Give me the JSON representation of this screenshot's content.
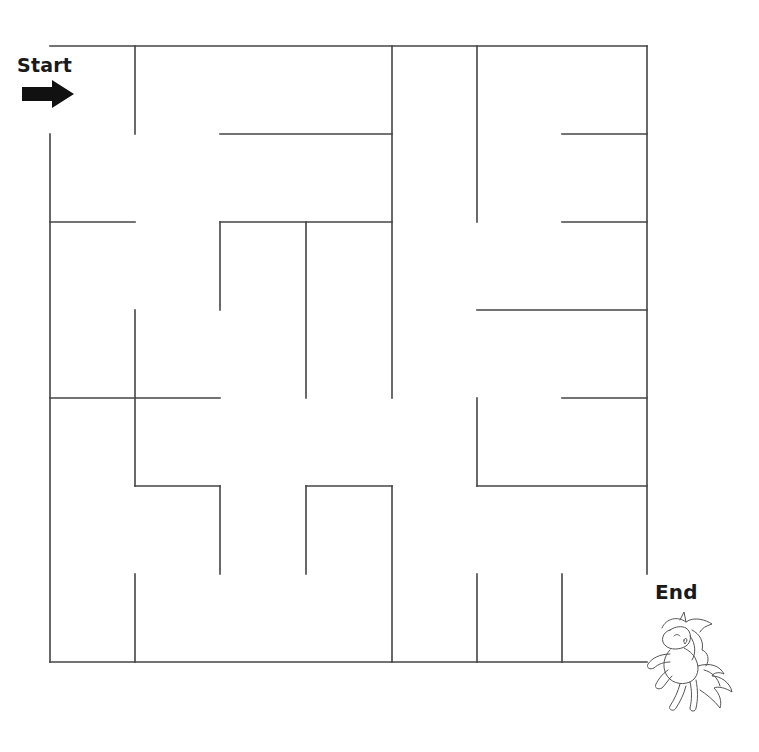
{
  "labels": {
    "start": "Start",
    "end": "End"
  },
  "icons": {
    "start_arrow": "right-arrow-icon",
    "end_character": "unicorn-icon"
  },
  "colors": {
    "wall": "#444444",
    "background": "#ffffff",
    "text": "#1a1a1a"
  },
  "maze": {
    "rows": 7,
    "cols": 7,
    "grid_x": [
      50,
      135,
      220,
      306,
      392,
      477,
      562,
      647
    ],
    "grid_y": [
      46,
      134,
      222,
      310,
      398,
      486,
      574,
      662
    ],
    "entrance": {
      "side": "left",
      "row": 0
    },
    "exit": {
      "side": "right",
      "row": 6
    },
    "walls": [
      [
        0,
        0,
        7,
        0
      ],
      [
        0,
        1,
        0,
        7
      ],
      [
        0,
        7,
        7,
        7
      ],
      [
        7,
        0,
        7,
        6
      ],
      [
        1,
        0,
        1,
        1
      ],
      [
        1,
        3,
        1,
        5
      ],
      [
        1,
        6,
        1,
        7
      ],
      [
        2,
        1,
        4,
        1
      ],
      [
        6,
        1,
        7,
        1
      ],
      [
        4,
        0,
        4,
        4
      ],
      [
        4,
        5,
        4,
        7
      ],
      [
        5,
        0,
        5,
        2
      ],
      [
        5,
        4,
        5,
        5
      ],
      [
        5,
        6,
        5,
        7
      ],
      [
        0,
        2,
        1,
        2
      ],
      [
        2,
        2,
        4,
        2
      ],
      [
        6,
        2,
        7,
        2
      ],
      [
        2,
        2,
        2,
        3
      ],
      [
        2,
        5,
        2,
        6
      ],
      [
        3,
        2,
        3,
        4
      ],
      [
        3,
        5,
        3,
        6
      ],
      [
        5,
        3,
        7,
        3
      ],
      [
        0,
        4,
        2,
        4
      ],
      [
        6,
        4,
        7,
        4
      ],
      [
        1,
        5,
        2,
        5
      ],
      [
        3,
        5,
        4,
        5
      ],
      [
        5,
        5,
        7,
        5
      ],
      [
        6,
        6,
        6,
        7
      ]
    ]
  }
}
